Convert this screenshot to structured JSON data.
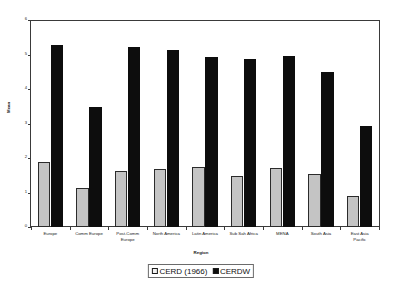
{
  "chart_data": {
    "type": "bar",
    "title": "",
    "xlabel": "Region",
    "ylabel": "Mean",
    "ylim": [
      0,
      6
    ],
    "yticks": [
      "0",
      "1",
      "2",
      "3",
      "4",
      "5",
      "6"
    ],
    "grid": false,
    "legend_position": "bottom",
    "categories": [
      "Europe",
      "Comm Europe",
      "Post-Comm Europe",
      "North America",
      "Latin America",
      "Sub Sah Africa",
      "MENA",
      "South Asia",
      "East Asia Pacific"
    ],
    "category_lines": [
      [
        "Europe"
      ],
      [
        "Comm Europe"
      ],
      [
        "Post-Comm",
        "Europe"
      ],
      [
        "North America"
      ],
      [
        "Latin America"
      ],
      [
        "Sub Sah Africa"
      ],
      [
        "MENA"
      ],
      [
        "South Asia"
      ],
      [
        "East Asia",
        "Pacific"
      ]
    ],
    "series": [
      {
        "name": "CERD (1966)",
        "color": "#c4c4c4",
        "values": [
          1.88,
          1.13,
          1.63,
          1.68,
          1.74,
          1.47,
          1.71,
          1.55,
          0.9
        ]
      },
      {
        "name": "CERDW",
        "color": "#0d0d0d",
        "values": [
          5.28,
          3.48,
          5.22,
          5.14,
          4.93,
          4.87,
          4.96,
          4.49,
          2.92
        ]
      }
    ]
  },
  "legend": {
    "items": [
      {
        "label": "CERD (1966)",
        "swatch": "cerd"
      },
      {
        "label": "CERDW",
        "swatch": "cerdw"
      }
    ]
  }
}
